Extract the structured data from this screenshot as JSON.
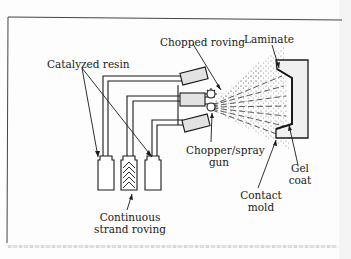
{
  "figure": {
    "labels": {
      "catalyzed_resin": "Catalyzed resin",
      "chopped_roving": "Chopped roving",
      "laminate": "Laminate",
      "chopper_spray_gun_line1": "Chopper/spray",
      "chopper_spray_gun_line2": "gun",
      "gel_coat_line1": "Gel",
      "gel_coat_line2": "coat",
      "continuous_strand_roving_line1": "Continuous",
      "continuous_strand_roving_line2": "strand roving",
      "contact_mold_line1": "Contact",
      "contact_mold_line2": "mold"
    },
    "colors": {
      "line": "#1a1a1a",
      "component_fill": "#e6e6e6",
      "spray_dots": "#8a8a8a",
      "frame": "#444444"
    }
  }
}
